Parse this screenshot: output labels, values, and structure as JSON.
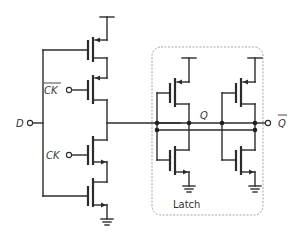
{
  "diagram": {
    "labels": {
      "input_d": "D",
      "clock_bar": "CK",
      "clock": "CK",
      "node_q": "Q",
      "output_q_bar": "Q",
      "latch_box": "Latch"
    },
    "overbars": [
      "clock_bar",
      "output_q_bar"
    ],
    "colors": {
      "wire": "#2b2b2b",
      "box": "#9a9a9a",
      "text": "#333333",
      "background": "#ffffff"
    },
    "components": [
      {
        "type": "pmos",
        "role": "data-pmos",
        "gate": "D"
      },
      {
        "type": "pmos",
        "role": "clock-pmos",
        "gate": "CK_bar"
      },
      {
        "type": "nmos",
        "role": "clock-nmos",
        "gate": "CK"
      },
      {
        "type": "nmos",
        "role": "data-nmos",
        "gate": "D"
      },
      {
        "type": "inverter",
        "role": "latch-inverter-1"
      },
      {
        "type": "inverter",
        "role": "latch-inverter-2"
      }
    ]
  }
}
